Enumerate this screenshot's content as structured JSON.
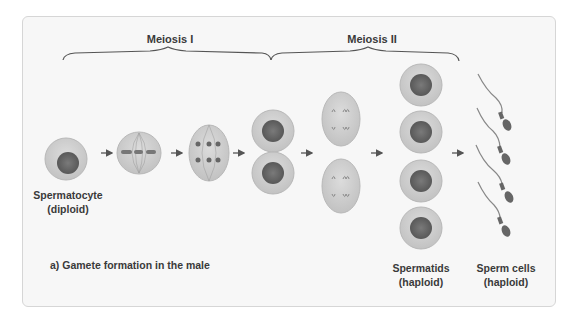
{
  "phases": {
    "meiosis_1": "Meiosis I",
    "meiosis_2": "Meiosis II"
  },
  "labels": {
    "spermatocyte": "Spermatocyte",
    "spermatocyte_ploidy": "(diploid)",
    "spermatids": "Spermatids",
    "spermatids_ploidy": "(haploid)",
    "sperm_cells": "Sperm cells",
    "sperm_cells_ploidy": "(haploid)"
  },
  "caption": "a) Gamete formation in the male",
  "colors": {
    "panel_bg": "#f7f7f7",
    "cell_fill": "#cfcfcf",
    "cell_edge": "#b8b8b8",
    "nucleus": "#6a6a6a",
    "text": "#3a3a3a",
    "arrow": "#555555"
  }
}
